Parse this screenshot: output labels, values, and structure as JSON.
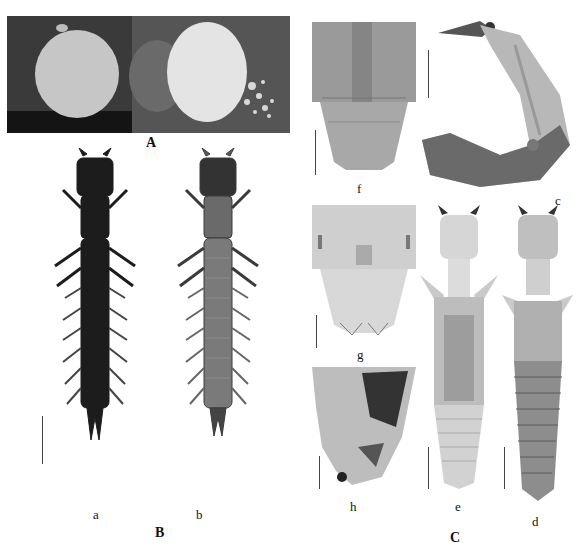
{
  "figure": {
    "clipped_caption_top": "",
    "panels": {
      "A": {
        "label": "A",
        "description": "Two egg/cocoon views: left pale round disc on dark background, right white fluffy disc with debris",
        "colors": {
          "bg_dark": "#2a2a2a",
          "bg_mid": "#5a5a5a",
          "disc_left": "#c9c9c9",
          "disc_right": "#e6e6e6"
        }
      },
      "B": {
        "label": "B",
        "subpanels": [
          {
            "id": "a",
            "label": "a",
            "description": "Larva dorsal view, dark",
            "color": "#1c1c1c"
          },
          {
            "id": "b",
            "label": "b",
            "description": "Larva ventral view, grey",
            "color": "#5c5c5c"
          }
        ]
      },
      "C": {
        "label": "C",
        "subpanels": [
          {
            "id": "f",
            "label": "f",
            "description": "Pupa abdominal apex, dorsal"
          },
          {
            "id": "c",
            "label": "c",
            "description": "Pupa lateral view, curved"
          },
          {
            "id": "g",
            "label": "g",
            "description": "Pupa abdominal apex, ventral"
          },
          {
            "id": "h",
            "label": "h",
            "description": "Pupa abdominal apex, lateral"
          },
          {
            "id": "e",
            "label": "e",
            "description": "Pupa ventral view, pale"
          },
          {
            "id": "d",
            "label": "d",
            "description": "Pupa dorsal view"
          }
        ]
      }
    }
  }
}
